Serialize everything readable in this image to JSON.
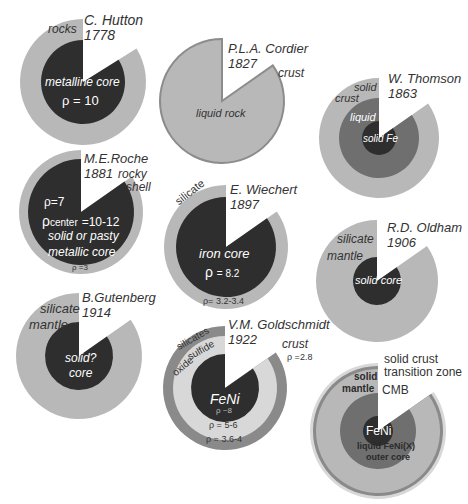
{
  "colors": {
    "background": "#ffffff",
    "light_gray": "#b8b8b8",
    "pale_gray": "#d8d8d8",
    "mid_gray": "#8a8a8a",
    "dark_gray": "#6f6f6f",
    "core_dark": "#2e2e2e",
    "outline": "#8c8c8c"
  },
  "models": [
    {
      "id": "hutton",
      "author": "C. Hutton",
      "year": "1778",
      "cx": 83,
      "cy": 82,
      "wedge_deg": 58,
      "layers": [
        {
          "r": 63,
          "color": "light_gray",
          "label": "rocks"
        },
        {
          "r": 42,
          "color": "core_dark",
          "label": "metalline core"
        }
      ],
      "annotations": [
        "ρ = 10"
      ]
    },
    {
      "id": "cordier",
      "author": "P.L.A. Cordier",
      "year": "1827",
      "cx": 222,
      "cy": 101,
      "wedge_deg": 55,
      "layers": [
        {
          "r": 62,
          "color": "light_gray",
          "outline": true,
          "label": "liquid rock"
        }
      ],
      "annotations": [
        "crust"
      ]
    },
    {
      "id": "thomson",
      "author": "W. Thomson",
      "year": "1863",
      "cx": 379,
      "cy": 138,
      "wedge_deg": 55,
      "layers": [
        {
          "r": 60,
          "color": "light_gray",
          "label": "solid crust"
        },
        {
          "r": 40,
          "color": "dark_gray",
          "label": "liquid"
        },
        {
          "r": 17,
          "color": "core_dark",
          "label": "solid Fe"
        }
      ]
    },
    {
      "id": "roche",
      "author": "M.E.Roche",
      "year": "1881",
      "cx": 81,
      "cy": 212,
      "wedge_deg": 55,
      "layers": [
        {
          "r": 62,
          "color": "light_gray",
          "label": "rocky shell"
        },
        {
          "r": 53,
          "color": "core_dark",
          "label": "solid or pasty metallic core"
        }
      ],
      "annotations": [
        "ρ=7",
        "ρcenter =10-12",
        "ρ =3"
      ]
    },
    {
      "id": "wiechert",
      "author": "E. Wiechert",
      "year": "1897",
      "cx": 226,
      "cy": 247,
      "wedge_deg": 55,
      "layers": [
        {
          "r": 62,
          "color": "light_gray",
          "label": "silicate"
        },
        {
          "r": 50,
          "color": "core_dark",
          "label": "iron core"
        }
      ],
      "annotations": [
        "ρ = 8.2",
        "ρ= 3.2-3.4"
      ]
    },
    {
      "id": "oldham",
      "author": "R.D. Oldham",
      "year": "1906",
      "cx": 377,
      "cy": 281,
      "wedge_deg": 55,
      "layers": [
        {
          "r": 61,
          "color": "light_gray",
          "label": "silicate mantle"
        },
        {
          "r": 24,
          "color": "core_dark",
          "label": "solid core"
        }
      ]
    },
    {
      "id": "gutenberg",
      "author": "B.Gutenberg",
      "year": "1914",
      "cx": 79,
      "cy": 356,
      "wedge_deg": 55,
      "layers": [
        {
          "r": 63,
          "color": "light_gray",
          "label": "silicate mantle"
        },
        {
          "r": 34,
          "color": "core_dark",
          "label": "solid? core"
        }
      ]
    },
    {
      "id": "goldschmidt",
      "author": "V.M. Goldschmidt",
      "year": "1922",
      "cx": 225,
      "cy": 388,
      "wedge_deg": 55,
      "layers": [
        {
          "r": 62,
          "color": "mid_gray",
          "label": "silicates"
        },
        {
          "r": 52,
          "color": "pale_gray",
          "label": "oxide sulfide"
        },
        {
          "r": 34,
          "color": "core_dark",
          "label": "FeNi"
        }
      ],
      "annotations": [
        "ρ ~8",
        "ρ = 5-6",
        "ρ = 3.6-4",
        "crust",
        "ρ =2.8"
      ]
    },
    {
      "id": "modern",
      "author": "",
      "year": "",
      "cx": 378,
      "cy": 431,
      "wedge_deg": 55,
      "layers": [
        {
          "r": 68,
          "color": "pale_gray",
          "label": "solid crust"
        },
        {
          "r": 65,
          "color": "mid_gray",
          "label": "transition zone"
        },
        {
          "r": 62,
          "color": "light_gray",
          "label": "solid mantle"
        },
        {
          "r": 38,
          "color": "dark_gray",
          "label": "liquid FeNi(X) outer core"
        },
        {
          "r": 15,
          "color": "core_dark",
          "label": "FeNi"
        }
      ],
      "annotations": [
        "CMB"
      ]
    }
  ],
  "labels": {
    "hutton_name": "C. Hutton",
    "hutton_year": "1778",
    "hutton_rocks": "rocks",
    "hutton_core": "metalline core",
    "hutton_rho": "ρ = 10",
    "cordier_name": "P.L.A. Cordier",
    "cordier_year": "1827",
    "cordier_crust": "crust",
    "cordier_liquid": "liquid rock",
    "thomson_name": "W. Thomson",
    "thomson_year": "1863",
    "thomson_solid": "solid",
    "thomson_crust": "crust",
    "thomson_liquid": "liquid",
    "thomson_fe": "solid Fe",
    "roche_name": "M.E.Roche",
    "roche_year": "1881",
    "roche_rocky": "rocky",
    "roche_shell": "shell",
    "roche_rho7": "ρ=7",
    "roche_rho_center_sym": "ρ",
    "roche_rho_center_sub": "center",
    "roche_rho_center_val": "=10-12",
    "roche_core1": "solid or pasty",
    "roche_core2": "metallic core",
    "roche_rho3": "ρ =3",
    "wiechert_name": "E. Wiechert",
    "wiechert_year": "1897",
    "wiechert_silicate": "silicate",
    "wiechert_core": "iron core",
    "wiechert_rho_sym": "ρ",
    "wiechert_rho_val": "= 8.2",
    "wiechert_rho_shell": "ρ= 3.2-3.4",
    "oldham_name": "R.D. Oldham",
    "oldham_year": "1906",
    "oldham_silicate": "silicate",
    "oldham_mantle": "mantle",
    "oldham_core": "solid core",
    "gutenberg_name": "B.Gutenberg",
    "gutenberg_year": "1914",
    "gutenberg_silicate": "silicate",
    "gutenberg_mantle": "mantle",
    "gutenberg_core1": "solid?",
    "gutenberg_core2": "core",
    "goldschmidt_name": "V.M. Goldschmidt",
    "goldschmidt_year": "1922",
    "goldschmidt_silicates": "silicates",
    "goldschmidt_sulfide": "sulfide",
    "goldschmidt_oxide": "oxide",
    "goldschmidt_crust": "crust",
    "goldschmidt_crust_rho": "ρ =2.8",
    "goldschmidt_core": "FeNi",
    "goldschmidt_core_rho": "ρ ~8",
    "goldschmidt_rho56": "ρ = 5-6",
    "goldschmidt_rho364": "ρ = 3.6-4",
    "modern_solid_crust": "solid crust",
    "modern_transition": "transition zone",
    "modern_solid": "solid",
    "modern_mantle": "mantle",
    "modern_cmb": "CMB",
    "modern_feni": "FeNi",
    "modern_outer1": "liquid FeNi(X)",
    "modern_outer2": "outer core"
  }
}
